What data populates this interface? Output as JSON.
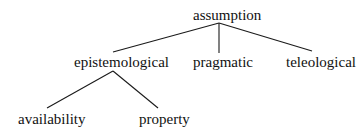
{
  "tree": {
    "root": {
      "label": "assumption"
    },
    "level1": [
      {
        "label": "epistemological"
      },
      {
        "label": "pragmatic"
      },
      {
        "label": "teleological"
      }
    ],
    "level2": [
      {
        "label": "availability",
        "parent": "epistemological"
      },
      {
        "label": "property",
        "parent": "epistemological"
      }
    ]
  },
  "colors": {
    "line": "#1a1a1a",
    "text": "#111111",
    "background": "#ffffff"
  }
}
